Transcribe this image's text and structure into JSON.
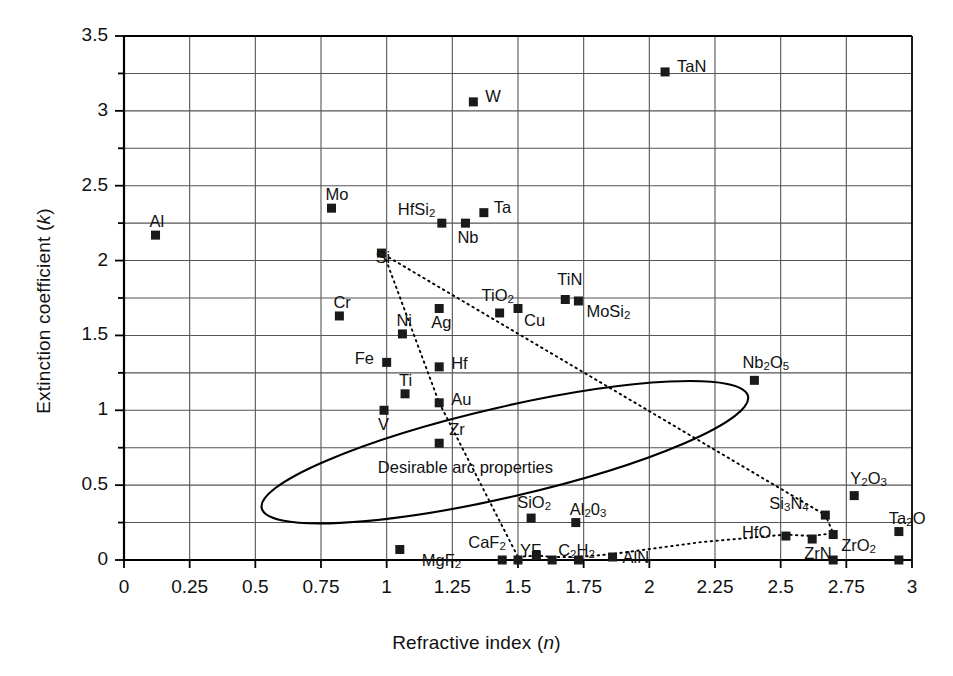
{
  "chart_data": {
    "type": "scatter",
    "title": "",
    "xlabel": "Refractive index (n)",
    "ylabel": "Extinction coefficient (k)",
    "xlim": [
      0,
      3
    ],
    "ylim": [
      0,
      3.5
    ],
    "xticks": [
      "0",
      "0.25",
      "0.5",
      "0.75",
      "1",
      "1.25",
      "1.5",
      "1.75",
      "2",
      "2.25",
      "2.5",
      "2.75",
      "3"
    ],
    "ytick_values": [
      0,
      0.5,
      1,
      1.5,
      2,
      2.5,
      3,
      3.5
    ],
    "yticks": [
      "0",
      "0.5",
      "1",
      "1.5",
      "2",
      "2.5",
      "3",
      "3.5"
    ],
    "grid": true,
    "minor_grid_y": true,
    "legend": "none",
    "marker": "filled-square",
    "points": [
      {
        "label": "Al",
        "x": 0.12,
        "y": 2.17,
        "lx": -6,
        "ly": -22
      },
      {
        "label": "Mo",
        "x": 0.79,
        "y": 2.35,
        "lx": -6,
        "ly": -22
      },
      {
        "label": "Cr",
        "x": 0.82,
        "y": 1.63,
        "lx": -6,
        "ly": -22
      },
      {
        "label": "Si",
        "x": 0.98,
        "y": 2.05,
        "lx": -6,
        "ly": -4
      },
      {
        "label": "HfSi",
        "sub": "2",
        "x": 1.21,
        "y": 2.25,
        "lx": -44,
        "ly": -22
      },
      {
        "label": "Nb",
        "x": 1.3,
        "y": 2.25,
        "lx": -8,
        "ly": 6
      },
      {
        "label": "Ta",
        "x": 1.37,
        "y": 2.32,
        "lx": 10,
        "ly": -14
      },
      {
        "label": "W",
        "x": 1.33,
        "y": 3.06,
        "lx": 12,
        "ly": -14
      },
      {
        "label": "TaN",
        "x": 2.06,
        "y": 3.26,
        "lx": 12,
        "ly": -14
      },
      {
        "label": "Ni",
        "x": 1.06,
        "y": 1.51,
        "lx": -6,
        "ly": -22
      },
      {
        "label": "Fe",
        "x": 1.0,
        "y": 1.32,
        "lx": -32,
        "ly": -12
      },
      {
        "label": "Ti",
        "x": 1.07,
        "y": 1.11,
        "lx": -6,
        "ly": -22
      },
      {
        "label": "V",
        "x": 0.99,
        "y": 1.0,
        "lx": -6,
        "ly": 6
      },
      {
        "label": "Ag",
        "x": 1.2,
        "y": 1.68,
        "lx": -8,
        "ly": 6
      },
      {
        "label": "Hf",
        "x": 1.2,
        "y": 1.29,
        "lx": 12,
        "ly": -12
      },
      {
        "label": "Au",
        "x": 1.2,
        "y": 1.05,
        "lx": 12,
        "ly": -12
      },
      {
        "label": "Zr",
        "x": 1.2,
        "y": 0.78,
        "lx": 10,
        "ly": -22
      },
      {
        "label": "TiO",
        "sub": "2",
        "x": 1.43,
        "y": 1.65,
        "lx": -18,
        "ly": -26
      },
      {
        "label": "Cu",
        "x": 1.5,
        "y": 1.68,
        "lx": 6,
        "ly": 4
      },
      {
        "label": "TiN",
        "x": 1.68,
        "y": 1.74,
        "lx": -8,
        "ly": -28
      },
      {
        "label": "MoSi",
        "sub": "2",
        "x": 1.73,
        "y": 1.73,
        "lx": 8,
        "ly": 2
      },
      {
        "label": "Nb",
        "sub": "2",
        "label2": "O",
        "sub2": "5",
        "x": 2.4,
        "y": 1.2,
        "lx": -12,
        "ly": -26
      },
      {
        "label": "Y",
        "sub": "2",
        "label2": "O",
        "sub2": "3",
        "x": 2.78,
        "y": 0.43,
        "lx": -4,
        "ly": -26
      },
      {
        "label": "Si",
        "sub": "3",
        "label2": "N",
        "sub2": "4",
        "x": 2.67,
        "y": 0.3,
        "lx": -56,
        "ly": -20
      },
      {
        "label": "HfO",
        "x": 2.52,
        "y": 0.16,
        "lx": -44,
        "ly": -12
      },
      {
        "label": "ZrN",
        "x": 2.62,
        "y": 0.14,
        "lx": -8,
        "ly": 6
      },
      {
        "label": "ZrO",
        "sub": "2",
        "x": 2.7,
        "y": 0.17,
        "lx": 8,
        "ly": 2
      },
      {
        "label": "Ta",
        "sub": "2",
        "label2": "O",
        "x": 2.95,
        "y": 0.19,
        "lx": -10,
        "ly": -22
      },
      {
        "label": "MgF",
        "sub": "2",
        "x": 1.05,
        "y": 0.07,
        "lx": 22,
        "ly": 2
      },
      {
        "label": "CaF",
        "sub": "2",
        "x": 1.44,
        "y": 0.0,
        "lx": -34,
        "ly": -26
      },
      {
        "label": "YF",
        "x": 1.5,
        "y": 0.0,
        "lx": 2,
        "ly": -18
      },
      {
        "label": "",
        "x": 1.57,
        "y": 0.03,
        "lx": 0,
        "ly": 0
      },
      {
        "label": "C",
        "sub": "2",
        "label2": "H",
        "sub2": "2",
        "x": 1.63,
        "y": 0.0,
        "lx": 6,
        "ly": -18
      },
      {
        "label": "",
        "x": 1.73,
        "y": 0.0,
        "lx": 0,
        "ly": 0
      },
      {
        "label": "Al",
        "sub": "2",
        "label2": "0",
        "sub2": "3",
        "x": 1.72,
        "y": 0.25,
        "lx": -6,
        "ly": -22
      },
      {
        "label": "AlN",
        "x": 1.86,
        "y": 0.02,
        "lx": 10,
        "ly": -8
      },
      {
        "label": "SiO",
        "sub": "2",
        "x": 1.55,
        "y": 0.28,
        "lx": -14,
        "ly": -24
      },
      {
        "label": "",
        "x": 2.7,
        "y": 0.0,
        "lx": 0,
        "ly": 0
      },
      {
        "label": "",
        "x": 2.95,
        "y": 0.0,
        "lx": 0,
        "ly": 0
      }
    ],
    "annotations": [
      {
        "text": "Desirable arc properties",
        "x": 1.3,
        "y": 0.62
      }
    ],
    "shapes": [
      {
        "type": "ellipse",
        "note": "desirable-arc-properties-region",
        "cx": 1.45,
        "cy": 0.72,
        "rx": 0.95,
        "ry": 0.3,
        "rotation_deg": -13
      },
      {
        "type": "dotted-line",
        "note": "si-to-au",
        "from": [
          0.99,
          2.04
        ],
        "to": [
          1.2,
          1.05
        ]
      },
      {
        "type": "dotted-line",
        "note": "au-to-sio2",
        "from": [
          1.2,
          1.05
        ],
        "to": [
          1.5,
          0.02
        ]
      },
      {
        "type": "dotted-line",
        "note": "si-to-si3n4",
        "from": [
          0.99,
          2.04
        ],
        "to": [
          2.67,
          0.3
        ]
      },
      {
        "type": "dotted-line",
        "note": "bottom-chain",
        "points": [
          [
            1.5,
            0.02
          ],
          [
            1.57,
            0.03
          ],
          [
            1.63,
            0.02
          ],
          [
            1.73,
            0.02
          ],
          [
            1.86,
            0.04
          ],
          [
            2.2,
            0.12
          ],
          [
            2.52,
            0.17
          ],
          [
            2.62,
            0.16
          ],
          [
            2.7,
            0.18
          ],
          [
            2.67,
            0.3
          ]
        ]
      }
    ]
  },
  "axis": {
    "y_title_prefix": "Extinction coefficient (",
    "y_title_symbol": "k",
    "y_title_suffix": ")",
    "x_title_prefix": "Refractive index (",
    "x_title_symbol": "n",
    "x_title_suffix": ")"
  },
  "colors": {
    "marker": "#1a1a1a",
    "grid": "#555555",
    "axis": "#000000",
    "text": "#111111",
    "background": "#ffffff"
  }
}
